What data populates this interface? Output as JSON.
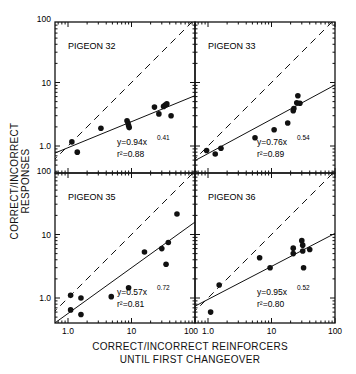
{
  "figure": {
    "ylabel": "CORRECT/INCORRECT RESPONSES",
    "xlabel_line1": "CORRECT/INCORRECT REINFORCERS",
    "xlabel_line2": "UNTIL FIRST CHANGEOVER"
  },
  "chart_data": [
    {
      "type": "scatter",
      "title": "PIGEON 32",
      "xscale": "log",
      "yscale": "log",
      "xlim": [
        0.8,
        100
      ],
      "ylim": [
        0.6,
        100
      ],
      "xticks": [
        "1.0",
        "10",
        "100"
      ],
      "yticks": [
        "1.0",
        "10",
        "100"
      ],
      "equation": "y=0.94x^0.41",
      "eq_coef": "y=0.94x",
      "eq_exp": "0.41",
      "r2": "0.88",
      "fit": {
        "a": 0.94,
        "b": 0.41
      },
      "reference_line": "y = x (dashed)",
      "points": [
        [
          1.15,
          1.16
        ],
        [
          1.4,
          0.8
        ],
        [
          3.3,
          1.9
        ],
        [
          8.5,
          2.5
        ],
        [
          8.8,
          2.3
        ],
        [
          9.0,
          2.1
        ],
        [
          9.2,
          1.95
        ],
        [
          23,
          4.1
        ],
        [
          27,
          3.2
        ],
        [
          32,
          4.2
        ],
        [
          34,
          4.4
        ],
        [
          36,
          4.6
        ],
        [
          42,
          3.0
        ]
      ]
    },
    {
      "type": "scatter",
      "title": "PIGEON 33",
      "xscale": "log",
      "yscale": "log",
      "xlim": [
        0.8,
        100
      ],
      "ylim": [
        0.6,
        100
      ],
      "xticks": [
        "1.0",
        "10",
        "100"
      ],
      "yticks": [
        "1.0",
        "10",
        "100"
      ],
      "equation": "y=0.76x^0.54",
      "eq_coef": "y=0.76x",
      "eq_exp": "0.54",
      "r2": "0.89",
      "fit": {
        "a": 0.76,
        "b": 0.54
      },
      "reference_line": "y = x (dashed)",
      "points": [
        [
          0.95,
          0.85
        ],
        [
          1.3,
          0.75
        ],
        [
          1.6,
          0.92
        ],
        [
          5.5,
          1.35
        ],
        [
          11,
          1.8
        ],
        [
          18,
          2.3
        ],
        [
          22,
          3.6
        ],
        [
          22.5,
          3.9
        ],
        [
          25,
          4.8
        ],
        [
          26,
          6.2
        ],
        [
          28,
          4.7
        ]
      ]
    },
    {
      "type": "scatter",
      "title": "PIGEON 35",
      "xscale": "log",
      "yscale": "log",
      "xlim": [
        0.8,
        100
      ],
      "ylim": [
        0.6,
        100
      ],
      "xticks": [
        "1.0",
        "10",
        "100"
      ],
      "yticks": [
        "1.0",
        "10",
        "100"
      ],
      "equation": "y=0.57x^0.72",
      "eq_coef": "y=0.57x",
      "eq_exp": "0.72",
      "r2": "0.81",
      "fit": {
        "a": 0.57,
        "b": 0.72
      },
      "reference_line": "y = x (dashed)",
      "points": [
        [
          1.1,
          1.1
        ],
        [
          1.1,
          0.65
        ],
        [
          1.6,
          1.0
        ],
        [
          1.6,
          0.55
        ],
        [
          4.8,
          1.05
        ],
        [
          9,
          1.45
        ],
        [
          16,
          5.3
        ],
        [
          30,
          6.0
        ],
        [
          35,
          3.4
        ],
        [
          38,
          7.5
        ],
        [
          52,
          21
        ]
      ]
    },
    {
      "type": "scatter",
      "title": "PIGEON 36",
      "xscale": "log",
      "yscale": "log",
      "xlim": [
        0.8,
        100
      ],
      "ylim": [
        0.6,
        100
      ],
      "xticks": [
        "1.0",
        "10",
        "100"
      ],
      "yticks": [
        "1.0",
        "10",
        "100"
      ],
      "equation": "y=0.95x^0.52",
      "eq_coef": "y=0.95x",
      "eq_exp": "0.52",
      "r2": "0.80",
      "fit": {
        "a": 0.95,
        "b": 0.52
      },
      "reference_line": "y = x (dashed)",
      "points": [
        [
          1.1,
          0.6
        ],
        [
          1.5,
          1.6
        ],
        [
          6.5,
          4.3
        ],
        [
          9.5,
          3.0
        ],
        [
          22,
          5.0
        ],
        [
          22,
          6.1
        ],
        [
          30,
          8.0
        ],
        [
          31,
          5.5
        ],
        [
          31,
          6.8
        ],
        [
          32,
          3.0
        ],
        [
          40,
          5.8
        ]
      ]
    }
  ]
}
